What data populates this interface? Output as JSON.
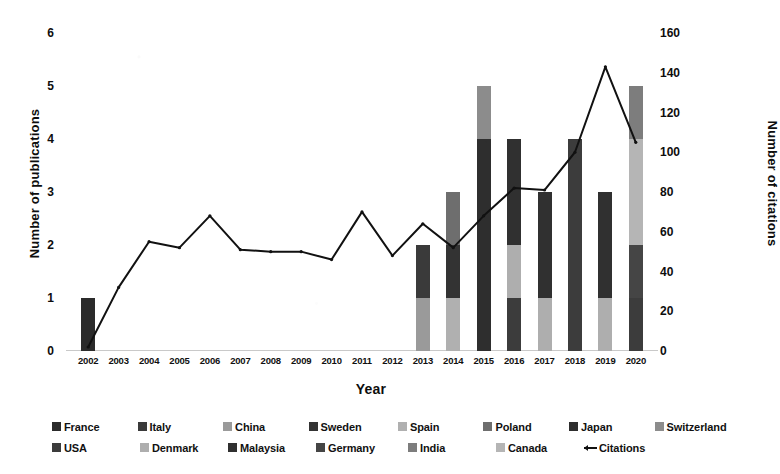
{
  "chart_data": {
    "type": "bar",
    "title": "",
    "xlabel": "Year",
    "ylabel": "Number of publications",
    "y2label": "Number of citations",
    "grid": false,
    "legend_position": "bottom",
    "ylim": [
      0,
      6
    ],
    "y2lim": [
      0,
      160
    ],
    "yticks": [
      "0",
      "1",
      "2",
      "3",
      "4",
      "5",
      "6"
    ],
    "y2ticks": [
      "0",
      "20",
      "40",
      "60",
      "80",
      "100",
      "120",
      "140",
      "160"
    ],
    "categories": [
      "2002",
      "2003",
      "2004",
      "2005",
      "2006",
      "2007",
      "2008",
      "2009",
      "2010",
      "2011",
      "2012",
      "2013",
      "2014",
      "2015",
      "2016",
      "2017",
      "2018",
      "2019",
      "2020"
    ],
    "stacked_totals": [
      1,
      0,
      0,
      0,
      0,
      0,
      0,
      0,
      0,
      0,
      0,
      2,
      3,
      5,
      4,
      3,
      4,
      3,
      5
    ],
    "series": [
      {
        "name": "France",
        "color": "#2b2b2b",
        "values": [
          1,
          0,
          0,
          0,
          0,
          0,
          0,
          0,
          0,
          0,
          0,
          0,
          0,
          0,
          0,
          0,
          0,
          0,
          0
        ]
      },
      {
        "name": "Italy",
        "color": "#3a3a3a",
        "values": [
          0,
          0,
          0,
          0,
          0,
          0,
          0,
          0,
          0,
          0,
          0,
          1,
          0,
          0,
          0,
          0,
          0,
          0,
          0
        ]
      },
      {
        "name": "China",
        "color": "#9a9a9a",
        "values": [
          0,
          0,
          0,
          0,
          0,
          0,
          0,
          0,
          0,
          0,
          0,
          1,
          0,
          0,
          0,
          0,
          0,
          0,
          0
        ]
      },
      {
        "name": "Sweden",
        "color": "#333333",
        "values": [
          0,
          0,
          0,
          0,
          0,
          0,
          0,
          0,
          0,
          0,
          0,
          0,
          1,
          0,
          0,
          0,
          0,
          0,
          0
        ]
      },
      {
        "name": "Spain",
        "color": "#b0b0b0",
        "values": [
          0,
          0,
          0,
          0,
          0,
          0,
          0,
          0,
          0,
          0,
          0,
          0,
          1,
          0,
          0,
          0,
          0,
          0,
          0
        ]
      },
      {
        "name": "Poland",
        "color": "#6e6e6e",
        "values": [
          0,
          0,
          0,
          0,
          0,
          0,
          0,
          0,
          0,
          0,
          0,
          0,
          1,
          0,
          0,
          0,
          0,
          0,
          0
        ]
      },
      {
        "name": "Japan",
        "color": "#2e2e2e",
        "values": [
          0,
          0,
          0,
          0,
          0,
          0,
          0,
          0,
          0,
          0,
          0,
          0,
          0,
          4,
          0,
          0,
          0,
          0,
          0
        ]
      },
      {
        "name": "Switzerland",
        "color": "#8c8c8c",
        "values": [
          0,
          0,
          0,
          0,
          0,
          0,
          0,
          0,
          0,
          0,
          0,
          0,
          0,
          1,
          0,
          0,
          0,
          0,
          0
        ]
      },
      {
        "name": "USA",
        "color": "#3c3c3c",
        "values": [
          0,
          0,
          0,
          0,
          0,
          0,
          0,
          0,
          0,
          0,
          0,
          0,
          0,
          0,
          1,
          0,
          4,
          0,
          1
        ]
      },
      {
        "name": "Denmark",
        "color": "#aeaeae",
        "values": [
          0,
          0,
          0,
          0,
          0,
          0,
          0,
          0,
          0,
          0,
          0,
          0,
          0,
          0,
          1,
          1,
          0,
          1,
          0
        ]
      },
      {
        "name": "Malaysia",
        "color": "#303030",
        "values": [
          0,
          0,
          0,
          0,
          0,
          0,
          0,
          0,
          0,
          0,
          0,
          0,
          0,
          0,
          2,
          2,
          0,
          2,
          0
        ]
      },
      {
        "name": "Germany",
        "color": "#454545",
        "values": [
          0,
          0,
          0,
          0,
          0,
          0,
          0,
          0,
          0,
          0,
          0,
          0,
          0,
          0,
          0,
          0,
          0,
          0,
          1
        ]
      },
      {
        "name": "India",
        "color": "#7d7d7d",
        "values": [
          0,
          0,
          0,
          0,
          0,
          0,
          0,
          0,
          0,
          0,
          0,
          0,
          0,
          0,
          0,
          0,
          0,
          0,
          1
        ]
      },
      {
        "name": "Canada",
        "color": "#b5b5b5",
        "values": [
          0,
          0,
          0,
          0,
          0,
          0,
          0,
          0,
          0,
          0,
          0,
          0,
          0,
          0,
          0,
          0,
          0,
          0,
          2
        ]
      }
    ],
    "line_series": {
      "name": "Citations",
      "color": "#111111",
      "axis": "right",
      "values": [
        2,
        32,
        55,
        52,
        68,
        51,
        50,
        50,
        46,
        70,
        48,
        64,
        52,
        68,
        82,
        81,
        100,
        143,
        105
      ]
    },
    "bar_stacks": [
      {
        "year": "2002",
        "segments": [
          {
            "country": "France",
            "value": 1,
            "color": "#2b2b2b"
          }
        ]
      },
      {
        "year": "2003",
        "segments": []
      },
      {
        "year": "2004",
        "segments": []
      },
      {
        "year": "2005",
        "segments": []
      },
      {
        "year": "2006",
        "segments": []
      },
      {
        "year": "2007",
        "segments": []
      },
      {
        "year": "2008",
        "segments": []
      },
      {
        "year": "2009",
        "segments": []
      },
      {
        "year": "2010",
        "segments": []
      },
      {
        "year": "2011",
        "segments": []
      },
      {
        "year": "2012",
        "segments": []
      },
      {
        "year": "2013",
        "segments": [
          {
            "country": "China",
            "value": 1,
            "color": "#9a9a9a"
          },
          {
            "country": "Italy",
            "value": 1,
            "color": "#3a3a3a"
          }
        ]
      },
      {
        "year": "2014",
        "segments": [
          {
            "country": "Spain",
            "value": 1,
            "color": "#b0b0b0"
          },
          {
            "country": "Sweden",
            "value": 1,
            "color": "#333333"
          },
          {
            "country": "Poland",
            "value": 1,
            "color": "#6e6e6e"
          }
        ]
      },
      {
        "year": "2015",
        "segments": [
          {
            "country": "Japan",
            "value": 4,
            "color": "#2e2e2e"
          },
          {
            "country": "Switzerland",
            "value": 1,
            "color": "#8c8c8c"
          }
        ]
      },
      {
        "year": "2016",
        "segments": [
          {
            "country": "USA",
            "value": 1,
            "color": "#3c3c3c"
          },
          {
            "country": "Denmark",
            "value": 1,
            "color": "#aeaeae"
          },
          {
            "country": "Malaysia",
            "value": 2,
            "color": "#303030"
          }
        ]
      },
      {
        "year": "2017",
        "segments": [
          {
            "country": "Denmark",
            "value": 1,
            "color": "#aeaeae"
          },
          {
            "country": "Malaysia",
            "value": 2,
            "color": "#303030"
          }
        ]
      },
      {
        "year": "2018",
        "segments": [
          {
            "country": "USA",
            "value": 4,
            "color": "#3c3c3c"
          }
        ]
      },
      {
        "year": "2019",
        "segments": [
          {
            "country": "Denmark",
            "value": 1,
            "color": "#aeaeae"
          },
          {
            "country": "Malaysia",
            "value": 2,
            "color": "#303030"
          }
        ]
      },
      {
        "year": "2020",
        "segments": [
          {
            "country": "USA",
            "value": 1,
            "color": "#3c3c3c"
          },
          {
            "country": "Germany",
            "value": 1,
            "color": "#454545"
          },
          {
            "country": "Canada",
            "value": 2,
            "color": "#b5b5b5"
          },
          {
            "country": "India",
            "value": 1,
            "color": "#7d7d7d"
          }
        ]
      }
    ]
  },
  "axes": {
    "left_title": "Number of publications",
    "right_title": "Number of citations",
    "x_title": "Year"
  },
  "legend": {
    "rows": [
      [
        {
          "label": "France",
          "color": "#2b2b2b",
          "kind": "swatch"
        },
        {
          "label": "Italy",
          "color": "#3a3a3a",
          "kind": "swatch"
        },
        {
          "label": "China",
          "color": "#9a9a9a",
          "kind": "swatch"
        },
        {
          "label": "Sweden",
          "color": "#333333",
          "kind": "swatch"
        },
        {
          "label": "Spain",
          "color": "#b0b0b0",
          "kind": "swatch"
        },
        {
          "label": "Poland",
          "color": "#6e6e6e",
          "kind": "swatch"
        },
        {
          "label": "Japan",
          "color": "#2e2e2e",
          "kind": "swatch"
        },
        {
          "label": "Switzerland",
          "color": "#8c8c8c",
          "kind": "swatch"
        }
      ],
      [
        {
          "label": "USA",
          "color": "#3c3c3c",
          "kind": "swatch"
        },
        {
          "label": "Denmark",
          "color": "#aeaeae",
          "kind": "swatch"
        },
        {
          "label": "Malaysia",
          "color": "#303030",
          "kind": "swatch"
        },
        {
          "label": "Germany",
          "color": "#454545",
          "kind": "swatch"
        },
        {
          "label": "India",
          "color": "#7d7d7d",
          "kind": "swatch"
        },
        {
          "label": "Canada",
          "color": "#b5b5b5",
          "kind": "swatch"
        },
        {
          "label": "Citations",
          "color": "#111111",
          "kind": "line"
        }
      ]
    ]
  },
  "colors": {
    "background": "#ffffff",
    "text": "#111111",
    "axis_line": "#c9c9c9",
    "line": "#111111"
  }
}
